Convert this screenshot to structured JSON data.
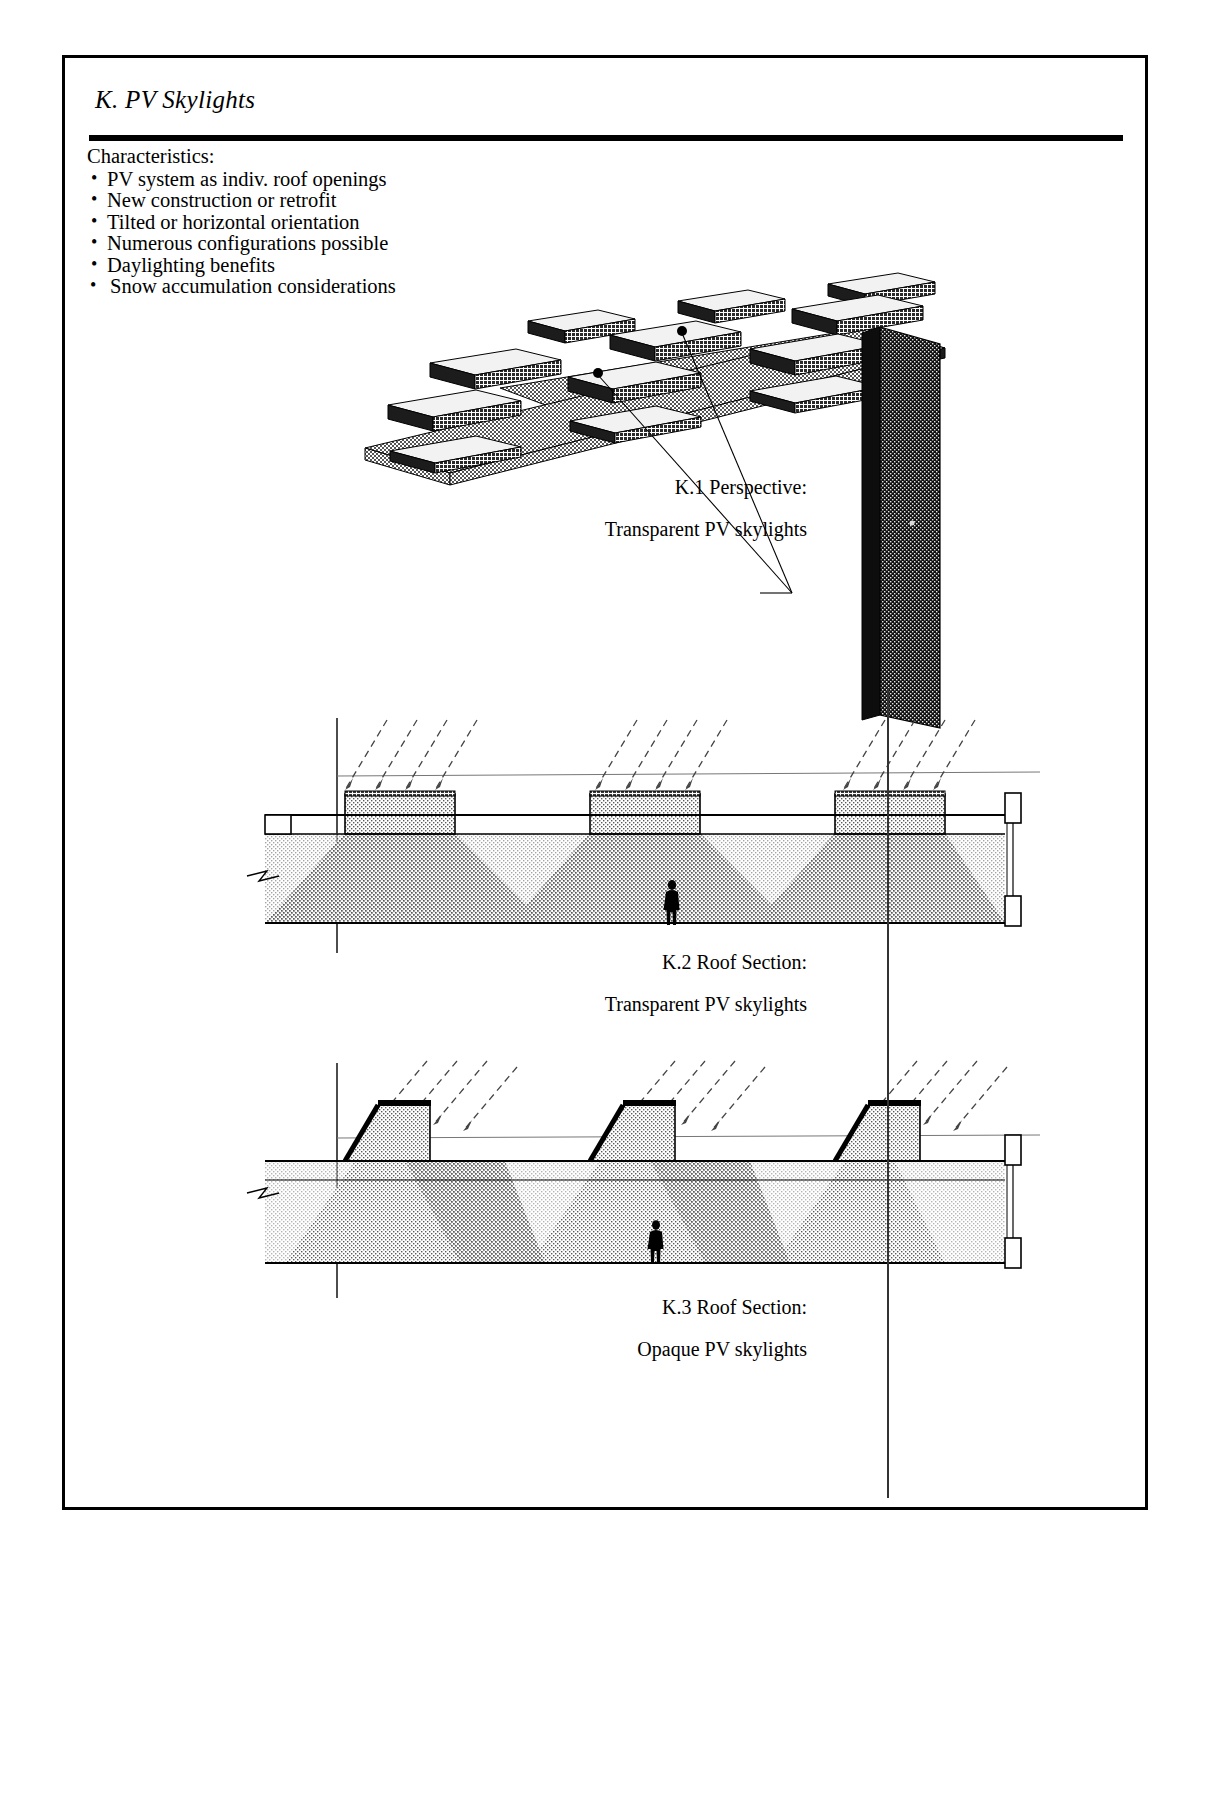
{
  "document": {
    "section_letter": "K.",
    "title": "K.  PV Skylights",
    "characteristics_label": "Characteristics:",
    "characteristics": [
      "PV system as indiv. roof openings",
      "New construction or retrofit",
      "Tilted or horizontal orientation",
      "Numerous configurations possible",
      "Daylighting benefits",
      "Snow accumulation considerations"
    ]
  },
  "figures": [
    {
      "id": "K.1",
      "caption_line1": "K.1  Perspective:",
      "caption_line2": "Transparent PV skylights",
      "type": "axonometric",
      "description": "Roof plane with individual raised skylight boxes and dark wall panel"
    },
    {
      "id": "K.2",
      "caption_line1": "K.2  Roof Section:",
      "caption_line2": "Transparent PV skylights",
      "type": "section",
      "description": "Flat roof section with three transparent skylight monitors and daylight distribution"
    },
    {
      "id": "K.3",
      "caption_line1": "K.3  Roof Section:",
      "caption_line2": "Opaque PV skylights",
      "type": "section",
      "description": "Roof section with three sawtooth monitors carrying opaque PV panels"
    }
  ],
  "colors": {
    "ink": "#000000",
    "paper": "#ffffff",
    "light_fill": "#d2d2d2",
    "mid_fill": "#b0b0b0",
    "dark_fill": "#8a8a8a",
    "panel_dark": "#3a3a3a"
  }
}
